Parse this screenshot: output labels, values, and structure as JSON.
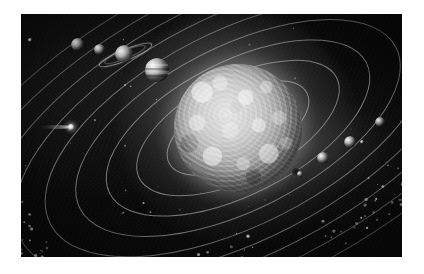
{
  "artwork": {
    "title": "Solar System",
    "style": "grayscale astronomical illustration",
    "background_color": "#090909",
    "frame": {
      "left": 21,
      "top": 14,
      "width": 381,
      "height": 243
    },
    "border_color": "#ffffff"
  },
  "sun": {
    "label": "Sun",
    "center_x": 238,
    "center_y": 128,
    "radius": 64,
    "core_color": "#e8e8e8",
    "limb_color": "#4e4e4e",
    "glow_color": "#bdbdbd",
    "sunspot": {
      "label": "Sunspot",
      "x": 296,
      "y": 172,
      "radius": 4,
      "color": "#141414"
    }
  },
  "bodies": [
    {
      "name": "Pluto",
      "x": 30,
      "y": 40,
      "radius": 1.8,
      "color": "#e0e0e0",
      "rings": false,
      "moon": false,
      "bands": false
    },
    {
      "name": "Neptune",
      "x": 77,
      "y": 44,
      "radius": 6.5,
      "color": "#c6c6c6",
      "rings": false,
      "moon": false,
      "bands": false
    },
    {
      "name": "Uranus",
      "x": 99,
      "y": 49,
      "radius": 5.5,
      "color": "#c0c0c0",
      "rings": false,
      "moon": false,
      "bands": false
    },
    {
      "name": "Saturn",
      "x": 124,
      "y": 54,
      "radius": 9.0,
      "color": "#d2d2d2",
      "rings": true,
      "moon": false,
      "bands": false
    },
    {
      "name": "Jupiter",
      "x": 157,
      "y": 70,
      "radius": 12.0,
      "color": "#d8d8d8",
      "rings": false,
      "moon": false,
      "bands": true
    },
    {
      "name": "Mars",
      "x": 380,
      "y": 122,
      "radius": 5.0,
      "color": "#b4b4b4",
      "rings": false,
      "moon": false,
      "bands": false
    },
    {
      "name": "Earth",
      "x": 350,
      "y": 142,
      "radius": 6.0,
      "color": "#c2c2c2",
      "rings": false,
      "moon": true,
      "bands": false
    },
    {
      "name": "Moon",
      "x": 362,
      "y": 142,
      "radius": 2.4,
      "color": "#d0d0d0",
      "rings": false,
      "moon": false,
      "bands": false
    },
    {
      "name": "Venus",
      "x": 323,
      "y": 158,
      "radius": 6.0,
      "color": "#bcbcbc",
      "rings": false,
      "moon": false,
      "bands": false
    },
    {
      "name": "Mercury",
      "x": 300,
      "y": 174,
      "radius": 3.2,
      "color": "#a8a8a8",
      "rings": false,
      "moon": false,
      "bands": false
    }
  ],
  "comet": {
    "name": "Comet",
    "head_x": 71,
    "head_y": 127,
    "head_radius": 3.2,
    "tail_length": 30,
    "tail_direction": "left",
    "color": "#e6e6e6"
  },
  "orbits": {
    "count": 9,
    "stroke_color": "#b9b9b9",
    "stroke_width": 1,
    "tilt_degrees": -27,
    "note": "concentric elliptical orbital paths centred on the Sun"
  },
  "belts": [
    {
      "name": "Asteroid Belt",
      "position": "lower-left",
      "particle_count": 120,
      "color": "#cfcfcf"
    },
    {
      "name": "Kuiper Belt",
      "position": "lower-right",
      "particle_count": 150,
      "color": "#c8c8c8"
    }
  ],
  "stars": {
    "count": 40,
    "color": "#d8d8d8"
  }
}
